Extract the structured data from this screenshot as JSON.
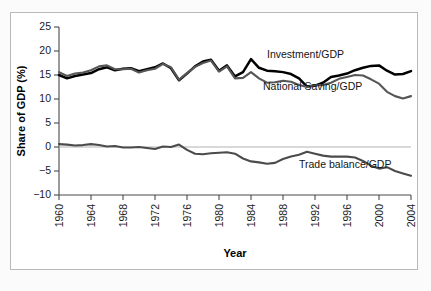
{
  "chart_data": {
    "type": "line",
    "title": "",
    "xlabel": "Year",
    "ylabel": "Share of GDP (%)",
    "xlim": [
      1960,
      2004
    ],
    "ylim": [
      -10,
      25
    ],
    "yticks": [
      25,
      20,
      15,
      10,
      5,
      0,
      -5,
      -10
    ],
    "ytick_labels": [
      "25",
      "20",
      "15",
      "10",
      "5",
      "0",
      "−5",
      "−10"
    ],
    "xticks": [
      1960,
      1964,
      1968,
      1972,
      1976,
      1980,
      1984,
      1988,
      1992,
      1996,
      2000,
      2004
    ],
    "xtick_labels": [
      "1960",
      "1964",
      "1968",
      "1972",
      "1976",
      "1980",
      "1984",
      "1988",
      "1992",
      "1996",
      "2000",
      "2004"
    ],
    "grid": false,
    "legend_position": "inline-annotations",
    "zero_reference_line": true,
    "x": [
      1960,
      1961,
      1962,
      1963,
      1964,
      1965,
      1966,
      1967,
      1968,
      1969,
      1970,
      1971,
      1972,
      1973,
      1974,
      1975,
      1976,
      1977,
      1978,
      1979,
      1980,
      1981,
      1982,
      1983,
      1984,
      1985,
      1986,
      1987,
      1988,
      1989,
      1990,
      1991,
      1992,
      1993,
      1994,
      1995,
      1996,
      1997,
      1998,
      1999,
      2000,
      2001,
      2002,
      2003,
      2004
    ],
    "series": [
      {
        "name": "Investment/GDP",
        "color": "#000000",
        "label_x": 1986.0,
        "label_y": 18.6,
        "values": [
          15.0,
          14.3,
          14.8,
          15.1,
          15.4,
          16.2,
          16.6,
          16.0,
          16.3,
          16.4,
          15.8,
          16.2,
          16.6,
          17.4,
          16.4,
          13.9,
          15.3,
          16.8,
          17.8,
          18.2,
          15.9,
          17.0,
          14.7,
          15.6,
          18.3,
          16.5,
          15.9,
          15.8,
          15.6,
          15.2,
          14.3,
          12.6,
          12.8,
          13.4,
          14.6,
          14.9,
          15.3,
          16.0,
          16.5,
          16.9,
          17.0,
          15.9,
          15.1,
          15.2,
          15.8
        ]
      },
      {
        "name": "National Saving/GDP",
        "color": "#565656",
        "label_x": 1985.5,
        "label_y": 11.9,
        "values": [
          15.6,
          14.8,
          15.3,
          15.5,
          16.0,
          16.8,
          17.0,
          16.2,
          16.2,
          16.3,
          15.5,
          16.0,
          16.3,
          17.3,
          16.6,
          14.0,
          15.4,
          16.7,
          17.5,
          18.0,
          15.7,
          16.8,
          14.3,
          14.4,
          15.6,
          14.3,
          13.4,
          13.5,
          13.8,
          13.6,
          12.9,
          12.5,
          12.9,
          12.9,
          13.4,
          14.2,
          14.6,
          15.0,
          14.9,
          14.1,
          13.2,
          11.5,
          10.6,
          10.1,
          10.6
        ]
      },
      {
        "name": "Trade balance/GDP",
        "color": "#4b4b4b",
        "label_x": 1990.0,
        "label_y": -4.3,
        "values": [
          0.6,
          0.5,
          0.3,
          0.4,
          0.6,
          0.4,
          0.1,
          0.2,
          -0.1,
          -0.1,
          0.0,
          -0.2,
          -0.4,
          0.1,
          0.0,
          0.5,
          -0.6,
          -1.4,
          -1.5,
          -1.3,
          -1.2,
          -1.1,
          -1.4,
          -2.4,
          -3.0,
          -3.2,
          -3.5,
          -3.3,
          -2.5,
          -2.0,
          -1.6,
          -1.0,
          -1.4,
          -1.8,
          -2.0,
          -2.0,
          -2.0,
          -2.2,
          -2.9,
          -3.9,
          -4.5,
          -4.2,
          -5.0,
          -5.5,
          -6.0
        ]
      }
    ]
  },
  "figure": {
    "source_note": ""
  }
}
